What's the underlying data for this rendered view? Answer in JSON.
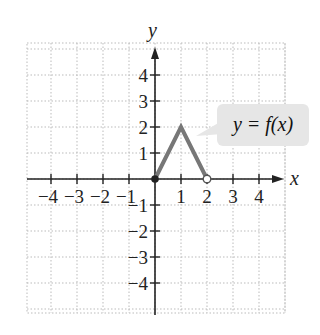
{
  "chart_data": {
    "type": "line",
    "title": "",
    "xlabel": "x",
    "ylabel": "y",
    "xlim": [
      -4.8,
      4.8
    ],
    "ylim": [
      -5.2,
      5.2
    ],
    "grid": true,
    "x_ticks": [
      -4,
      -3,
      -2,
      -1,
      1,
      2,
      3,
      4
    ],
    "x_tick_labels": [
      "−4",
      "−3",
      "−2",
      "−1",
      "1",
      "2",
      "3",
      "4"
    ],
    "y_ticks": [
      4,
      3,
      2,
      1,
      -1,
      -2,
      -3,
      -4
    ],
    "y_tick_labels": [
      "4",
      "3",
      "2",
      "1",
      "−1",
      "−2",
      "−3",
      "−4"
    ],
    "series": [
      {
        "name": "y = f(x)",
        "x": [
          0,
          1,
          2
        ],
        "y": [
          0,
          2,
          0
        ],
        "color": "#777777",
        "endpoints": [
          {
            "x": 0,
            "y": 0,
            "style": "closed"
          },
          {
            "x": 2,
            "y": 0,
            "style": "open"
          }
        ]
      }
    ],
    "annotations": [
      {
        "text": "y = f(x)",
        "points_to": [
          1.5,
          1.0
        ]
      }
    ]
  },
  "labels": {
    "x_axis": "x",
    "y_axis": "y",
    "callout": "y = f(x)"
  },
  "colors": {
    "curve": "#777777",
    "axis": "#222222",
    "grid": "#bbbbbb",
    "callout_bg": "#e6e6e6"
  }
}
